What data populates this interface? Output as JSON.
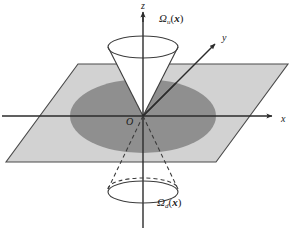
{
  "figure": {
    "axes": {
      "z_label": "z",
      "x_label": "x",
      "y_label": "y",
      "origin_label": "O"
    },
    "cones": {
      "upper": {
        "symbol": "Ω",
        "subscript": "u",
        "open_paren": "(",
        "argument": "x",
        "close_paren": ")",
        "line_style": "solid"
      },
      "lower": {
        "symbol": "Ω",
        "subscript": "d",
        "open_paren": "(",
        "argument": "x",
        "close_paren": ")",
        "line_style": "dashed"
      }
    },
    "colors": {
      "plane_fill": "#d2d2d2",
      "ellipse_fill": "#8f8f8f",
      "stroke": "#3c3c3c",
      "axis": "#2b2b2b",
      "background": "#ffffff",
      "text": "#1a1a1a"
    },
    "geometry": {
      "origin": {
        "x": 143,
        "y": 116
      },
      "plane_corners": [
        {
          "x": 78,
          "y": 64
        },
        {
          "x": 288,
          "y": 64
        },
        {
          "x": 216,
          "y": 162
        },
        {
          "x": 6,
          "y": 162
        }
      ],
      "ellipse": {
        "cx": 143,
        "cy": 116,
        "rx": 73,
        "ry": 37
      },
      "upper_cone_rim": {
        "cx": 143,
        "cy": 47,
        "rx": 35,
        "ry": 11
      },
      "lower_cone_rim": {
        "cx": 143,
        "cy": 189,
        "rx": 35,
        "ry": 11
      },
      "x_axis": {
        "x1": 2,
        "y1": 116,
        "x2": 278,
        "y2": 116
      },
      "z_axis": {
        "x1": 143,
        "y1": 10,
        "x2": 143,
        "y2": 226
      },
      "y_axis": {
        "x1": 143,
        "y1": 116,
        "x2": 219,
        "y2": 40
      }
    }
  }
}
